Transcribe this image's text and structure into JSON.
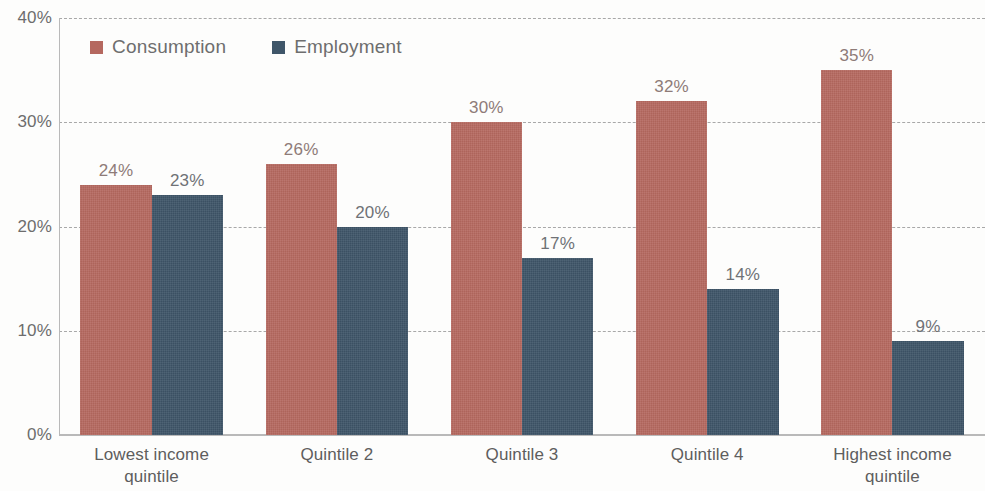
{
  "chart_data": {
    "type": "bar",
    "title": "",
    "subtitle": "",
    "xlabel": "",
    "ylabel": "",
    "ylim": [
      0,
      40
    ],
    "yticks": [
      "0%",
      "10%",
      "20%",
      "30%",
      "40%"
    ],
    "ytick_values": [
      0,
      10,
      20,
      30,
      40
    ],
    "grid": true,
    "grid_style": "dashed-horizontal",
    "legend_position": "top-left-inside",
    "value_suffix": "%",
    "categories": [
      "Lowest income quintile",
      "Quintile 2",
      "Quintile 3",
      "Quintile 4",
      "Highest income quintile"
    ],
    "category_lines": [
      [
        "Lowest income",
        "quintile"
      ],
      [
        "Quintile 2"
      ],
      [
        "Quintile 3"
      ],
      [
        "Quintile 4"
      ],
      [
        "Highest income",
        "quintile"
      ]
    ],
    "series": [
      {
        "name": "Consumption",
        "color": "#b5685f",
        "values": [
          24,
          26,
          30,
          32,
          35
        ],
        "labels": [
          "24%",
          "26%",
          "30%",
          "32%",
          "35%"
        ]
      },
      {
        "name": "Employment",
        "color": "#3f5669",
        "values": [
          23,
          20,
          17,
          14,
          9
        ],
        "labels": [
          "23%",
          "20%",
          "17%",
          "14%",
          "9%"
        ]
      }
    ]
  },
  "legend": {
    "items": [
      {
        "label": "Consumption",
        "color": "#b5685f"
      },
      {
        "label": "Employment",
        "color": "#3f5669"
      }
    ]
  },
  "colors": {
    "consumption": "#b5685f",
    "employment": "#3f5669",
    "gridline": "#a8a8a8",
    "axis": "#b9b9b9",
    "tick_text": "#6d6d6d",
    "category_text": "#5e5e5e",
    "background": "#fdfdfc"
  }
}
